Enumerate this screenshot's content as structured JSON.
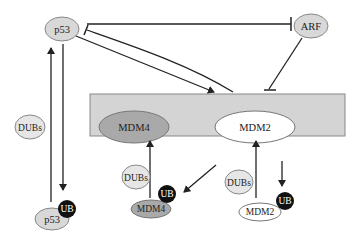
{
  "diagram": {
    "colors": {
      "node_light": "#d8d8d8",
      "node_mdm4": "#a9a9a9",
      "node_white": "#ffffff",
      "box_fill": "#d4d4d4",
      "ub_fill": "#111111",
      "line": "#222222"
    },
    "nodes": {
      "p53_top": "p53",
      "arf": "ARF",
      "mdm4_complex": "MDM4",
      "mdm2_complex": "MDM2",
      "dubs_left": "DUBs",
      "p53_ub": "p53",
      "ub_p53": "UB",
      "dubs_mdm4": "DUBs",
      "mdm4_ub": "MDM4",
      "ub_mdm4": "UB",
      "dubs_mdm2": "DUBs",
      "mdm2_ub": "MDM2",
      "ub_mdm2": "UB"
    },
    "edges": [
      {
        "from": "p53",
        "to": "ARF",
        "type": "inhibition"
      },
      {
        "from": "MDM2/MDM4 complex",
        "to": "p53",
        "type": "inhibition"
      },
      {
        "from": "p53",
        "to": "MDM2/MDM4 complex",
        "type": "activation"
      },
      {
        "from": "ARF",
        "to": "MDM2/MDM4 complex",
        "type": "inhibition"
      },
      {
        "from": "p53",
        "to": "p53-UB",
        "type": "activation"
      },
      {
        "from": "p53-UB",
        "to": "p53",
        "type": "activation",
        "via": "DUBs"
      },
      {
        "from": "MDM2/MDM4 complex",
        "to": "MDM4-UB",
        "type": "activation"
      },
      {
        "from": "MDM4-UB",
        "to": "MDM2/MDM4 complex",
        "type": "activation",
        "via": "DUBs"
      },
      {
        "from": "MDM2/MDM4 complex",
        "to": "MDM2-UB",
        "type": "activation"
      },
      {
        "from": "MDM2-UB",
        "to": "MDM2/MDM4 complex",
        "type": "activation",
        "via": "DUBs"
      }
    ]
  }
}
